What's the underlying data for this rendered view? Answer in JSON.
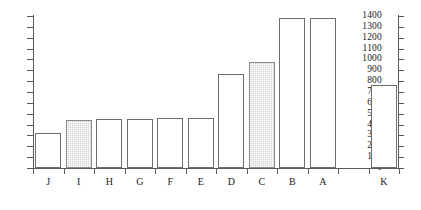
{
  "chart_data": {
    "type": "bar",
    "title": "",
    "subtitle": "",
    "xlabel": "",
    "ylabel": "",
    "categories": [
      "J",
      "I",
      "H",
      "G",
      "F",
      "E",
      "D",
      "C",
      "B",
      "A",
      "",
      "K"
    ],
    "values": [
      320,
      440,
      455,
      455,
      465,
      465,
      870,
      980,
      1385,
      1385,
      null,
      765
    ],
    "highlighted": [
      "I",
      "C"
    ],
    "bar_styles": [
      "open",
      "shaded",
      "open",
      "open",
      "open",
      "open",
      "open",
      "shaded",
      "open",
      "open",
      "none",
      "open"
    ],
    "ylim": [
      0,
      1400
    ],
    "y_tick_step": 100,
    "y_tick_labels": [
      "0",
      "100",
      "200",
      "300",
      "400",
      "500",
      "600",
      "700",
      "800",
      "900",
      "1000",
      "1100",
      "1200",
      "1300",
      "1400"
    ],
    "y_tick_values": [
      0,
      100,
      200,
      300,
      400,
      500,
      600,
      700,
      800,
      900,
      1000,
      1100,
      1200,
      1300,
      1400
    ],
    "grid": false,
    "legend": null,
    "legend_position": "none",
    "axes": {
      "left": {
        "ticks": true,
        "labels": true
      },
      "right": {
        "ticks": true,
        "labels": false
      },
      "bottom": {
        "ticks": true,
        "labels": true
      },
      "top": {
        "ticks": false,
        "labels": false
      }
    },
    "annotations": []
  },
  "colors": {
    "axis": "#5a5a5a",
    "bar_outline": "#6e6e6e",
    "bar_fill_open": "#ffffff",
    "bar_fill_shaded": "#d3d3d3",
    "background": "#ffffff",
    "text": "#1a1a1a"
  }
}
